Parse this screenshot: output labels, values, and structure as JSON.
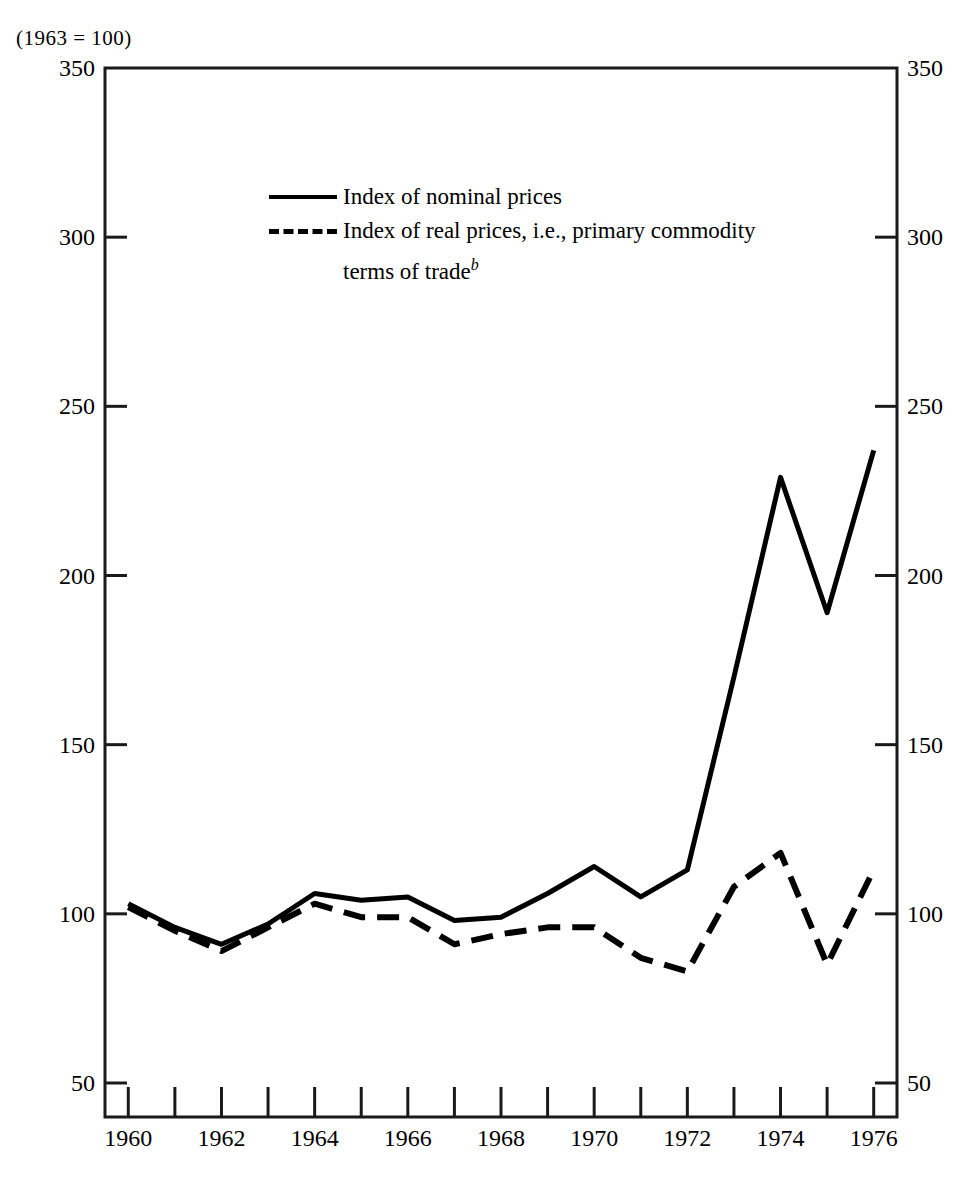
{
  "figure": {
    "unit_note": "(1963  =  100)",
    "footnote_marker": "b"
  },
  "legend": {
    "position": "inside-top-center",
    "items": [
      {
        "label": "Index of nominal prices",
        "style": "solid"
      },
      {
        "label": "Index of real prices, i.e., primary commodity",
        "label_line2": "terms of trade",
        "style": "dashed",
        "has_footnote": true
      }
    ]
  },
  "axes": {
    "y_left_ticks": [
      "350",
      "300",
      "250",
      "200",
      "150",
      "100",
      "50"
    ],
    "y_right_ticks": [
      "350",
      "300",
      "250",
      "200",
      "150",
      "100",
      "50"
    ],
    "x_ticks": [
      "1960",
      "1962",
      "1964",
      "1966",
      "1968",
      "1970",
      "1972",
      "1974",
      "1976"
    ]
  },
  "chart_data": {
    "type": "line",
    "title": "",
    "subtitle": "",
    "xlabel": "",
    "ylabel": "",
    "unit_note": "(1963 = 100)",
    "xlim": [
      1959.5,
      1976.5
    ],
    "ylim": [
      40,
      350
    ],
    "grid": false,
    "legend_position": "inside-top-center",
    "x": [
      1960,
      1961,
      1962,
      1963,
      1964,
      1965,
      1966,
      1967,
      1968,
      1969,
      1970,
      1971,
      1972,
      1973,
      1974,
      1975,
      1976
    ],
    "series": [
      {
        "name": "Index of nominal prices",
        "style": "solid",
        "values": [
          103,
          96,
          91,
          97,
          106,
          104,
          105,
          98,
          99,
          106,
          114,
          105,
          113,
          170,
          229,
          189,
          237
        ]
      },
      {
        "name": "Index of real prices, i.e., primary commodity terms of trade",
        "style": "dashed",
        "footnote": "b",
        "values": [
          102,
          95,
          89,
          96,
          103,
          99,
          99,
          91,
          94,
          96,
          96,
          87,
          83,
          108,
          118,
          85,
          113
        ]
      }
    ]
  }
}
